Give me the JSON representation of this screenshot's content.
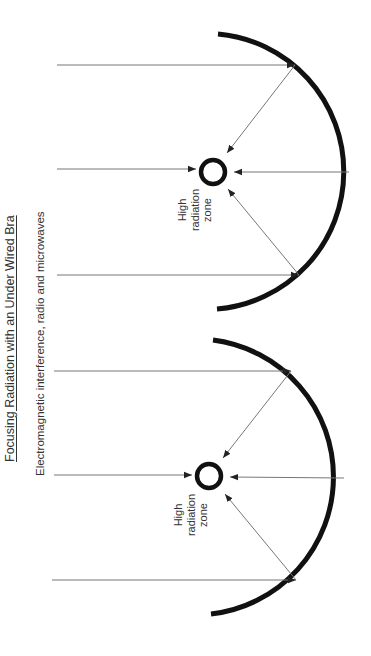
{
  "title": "Focusing Radiation with an Under Wired Bra",
  "subtitle": "Electromagnetic interference, radio and microwaves",
  "colors": {
    "reflector": "#111111",
    "ray": "#777777",
    "arrowhead": "#222222",
    "text": "#333333",
    "background": "#ffffff"
  },
  "diagrams": [
    {
      "id": "top",
      "focus": {
        "cx": 213,
        "cy": 172,
        "r": 12
      },
      "reflector": {
        "start": [
          218,
          34
        ],
        "apex": [
          350,
          172
        ],
        "end": [
          217,
          309
        ],
        "radius": 138
      },
      "incoming_rays_y": [
        64,
        168,
        274
      ],
      "ray_x_start": 57,
      "label_lines": [
        "High",
        "radiation",
        "zone"
      ]
    },
    {
      "id": "bottom",
      "focus": {
        "cx": 209,
        "cy": 476,
        "r": 12
      },
      "reflector": {
        "start": [
          213,
          340
        ],
        "apex": [
          345,
          478
        ],
        "end": [
          211,
          614
        ],
        "radius": 138
      },
      "incoming_rays_y": [
        371,
        475,
        580
      ],
      "ray_x_start": 54,
      "label_lines": [
        "High",
        "radiation",
        "zone"
      ]
    }
  ]
}
